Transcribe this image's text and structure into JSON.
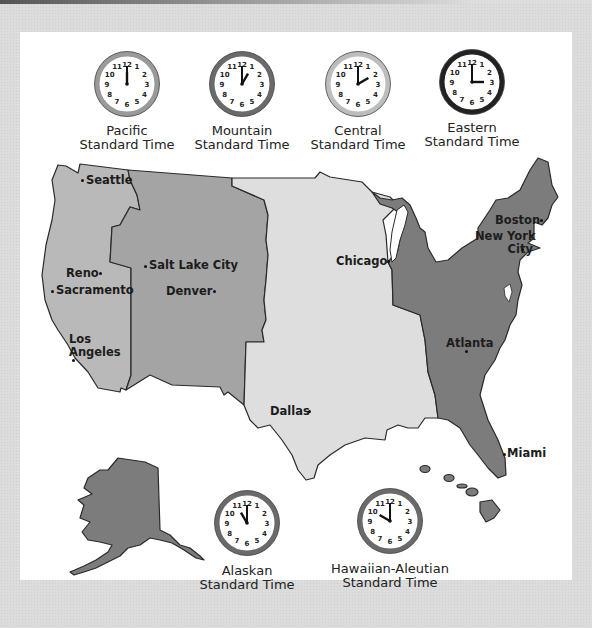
{
  "colors": {
    "background": "#dcdcdc",
    "panel": "#ffffff",
    "pacific": "#b9b9b9",
    "mountain": "#a4a4a4",
    "central": "#dedede",
    "eastern": "#7c7c7c",
    "alaska": "#7c7c7c",
    "hawaii": "#7c7c7c",
    "outline": "#2a2a2a"
  },
  "clocks": [
    {
      "id": "pacific",
      "line1": "Pacific",
      "line2": "Standard Time",
      "time": "12:00",
      "hour": 12,
      "minute": 0,
      "rim": "#9a9a9a"
    },
    {
      "id": "mountain",
      "line1": "Mountain",
      "line2": "Standard Time",
      "time": "1:00",
      "hour": 1,
      "minute": 0,
      "rim": "#6a6a6a"
    },
    {
      "id": "central",
      "line1": "Central",
      "line2": "Standard Time",
      "time": "2:00",
      "hour": 2,
      "minute": 0,
      "rim": "#bdbdbd"
    },
    {
      "id": "eastern",
      "line1": "Eastern",
      "line2": "Standard Time",
      "time": "3:00",
      "hour": 3,
      "minute": 0,
      "rim": "#222222"
    },
    {
      "id": "alaskan",
      "line1": "Alaskan",
      "line2": "Standard Time",
      "time": "11:00",
      "hour": 11,
      "minute": 0,
      "rim": "#6a6a6a"
    },
    {
      "id": "hawaiian",
      "line1": "Hawaiian-Aleutian",
      "line2": "Standard Time",
      "time": "10:00",
      "hour": 10,
      "minute": 0,
      "rim": "#6a6a6a"
    }
  ],
  "clock_numerals": [
    "12",
    "1",
    "2",
    "3",
    "4",
    "5",
    "6",
    "7",
    "8",
    "9",
    "10",
    "11"
  ],
  "cities": [
    {
      "name": "Seattle",
      "zone": "Pacific"
    },
    {
      "name": "Reno",
      "zone": "Pacific"
    },
    {
      "name": "Sacramento",
      "zone": "Pacific"
    },
    {
      "name": "Los Angeles",
      "line1": "Los",
      "line2": "Angeles",
      "zone": "Pacific"
    },
    {
      "name": "Salt Lake City",
      "zone": "Mountain"
    },
    {
      "name": "Denver",
      "zone": "Mountain"
    },
    {
      "name": "Chicago",
      "zone": "Central"
    },
    {
      "name": "Dallas",
      "zone": "Central"
    },
    {
      "name": "Boston",
      "zone": "Eastern"
    },
    {
      "name": "New York City",
      "line1": "New York",
      "line2": "City",
      "zone": "Eastern"
    },
    {
      "name": "Atlanta",
      "zone": "Eastern"
    },
    {
      "name": "Miami",
      "zone": "Eastern"
    }
  ]
}
